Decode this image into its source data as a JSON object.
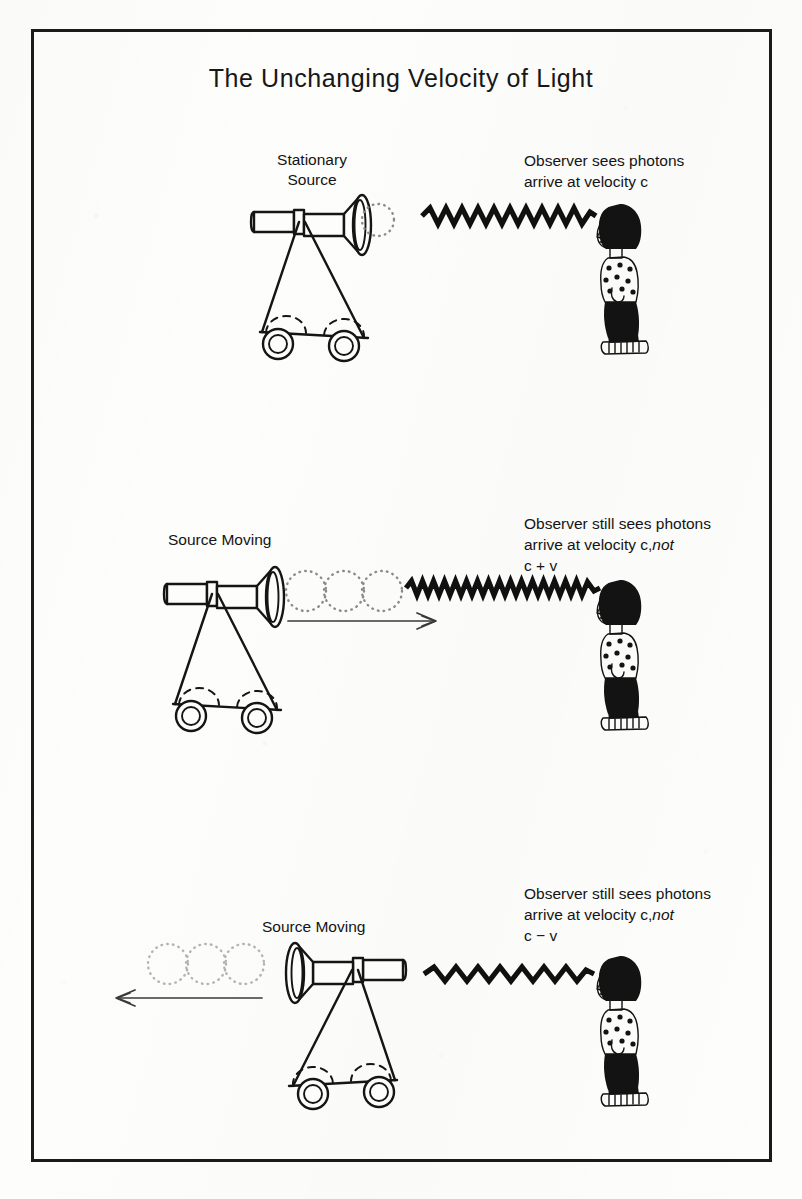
{
  "document": {
    "title": "The Unchanging Velocity of Light",
    "border_color": "#1a1a1a",
    "ink_color": "#131313",
    "paper_color": "#fdfdfc"
  },
  "panels": [
    {
      "id": "panel-stationary",
      "source_label": "Stationary\nSource",
      "observer_text_line1": "Observer sees photons",
      "observer_text_line2": "arrive at velocity c",
      "observer_text_italic": "",
      "observer_text_line3": "",
      "photon_circles": 1,
      "motion_arrow": "none",
      "source_facing": "right",
      "wave_cycles": 11
    },
    {
      "id": "panel-approaching",
      "source_label": "Source Moving",
      "observer_text_line1": "Observer still sees photons",
      "observer_text_line2": "arrive at velocity c,",
      "observer_text_italic": "not",
      "observer_text_line3": "c + v",
      "photon_circles": 3,
      "motion_arrow": "right",
      "source_facing": "right",
      "wave_cycles": 17
    },
    {
      "id": "panel-receding",
      "source_label": "Source Moving",
      "observer_text_line1": "Observer still sees photons",
      "observer_text_line2": "arrive at velocity c,",
      "observer_text_italic": "not",
      "observer_text_line3": "c − v",
      "photon_circles": 3,
      "motion_arrow": "left",
      "source_facing": "left",
      "wave_cycles": 8
    }
  ],
  "icons": {
    "source": "light-source-cart-icon",
    "observer": "observer-person-icon",
    "photon_wave": "photon-wave-icon",
    "photon_circle": "photon-circle-icon",
    "motion_arrow": "motion-arrow-icon"
  }
}
